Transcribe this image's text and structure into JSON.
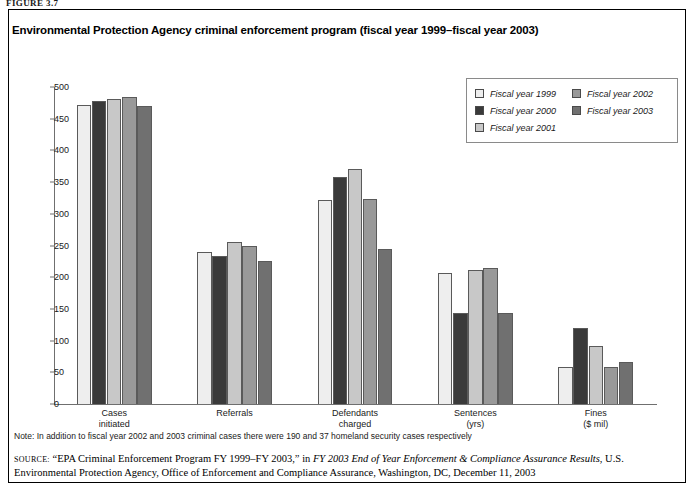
{
  "figure_label": "FIGURE 3.7",
  "chart_title": "Environmental Protection Agency criminal enforcement program (fiscal year 1999–fiscal year 2003)",
  "note": "Note: In addition to fiscal year 2002 and 2003 criminal cases there were 190 and 37 homeland security cases respectively",
  "source": {
    "label": "SOURCE:",
    "part1": " “EPA Criminal Enforcement Program FY 1999–FY 2003,” in ",
    "italic": "FY 2003 End of Year Enforcement & Compliance Assurance Results",
    "part2": ", U.S. Environmental Protection Agency, Office of Enforcement and Compliance Assurance, Washington, DC, December 11, 2003"
  },
  "legend": {
    "col1": [
      {
        "label": "Fiscal year 1999",
        "color": "#eeeeee"
      },
      {
        "label": "Fiscal year  2000",
        "color": "#3a3a3a"
      },
      {
        "label": "Fiscal year 2001",
        "color": "#c8c8c8"
      }
    ],
    "col2": [
      {
        "label": "Fiscal year 2002",
        "color": "#999999"
      },
      {
        "label": "Fiscal year 2003",
        "color": "#707070"
      }
    ]
  },
  "chart_data": {
    "type": "bar",
    "title": "Environmental Protection Agency criminal enforcement program (fiscal year 1999–fiscal year 2003)",
    "xlabel": "",
    "ylabel": "",
    "ylim": [
      0,
      500
    ],
    "yticks": [
      0,
      50,
      100,
      150,
      200,
      250,
      300,
      350,
      400,
      450,
      500
    ],
    "grid": false,
    "legend_position": "top-right",
    "categories": [
      "Cases\ninitiated",
      "Referrals",
      "Defendants\ncharged",
      "Sentences\n(yrs)",
      "Fines\n($ mil)"
    ],
    "category_lines": [
      [
        "Cases",
        "initiated"
      ],
      [
        "Referrals",
        ""
      ],
      [
        "Defendants",
        "charged"
      ],
      [
        "Sentences",
        "(yrs)"
      ],
      [
        "Fines",
        "($ mil)"
      ]
    ],
    "series": [
      {
        "name": "Fiscal year 1999",
        "color": "#eeeeee",
        "values": [
          472,
          239,
          322,
          207,
          59
        ]
      },
      {
        "name": "Fiscal year 2000",
        "color": "#3a3a3a",
        "values": [
          478,
          234,
          358,
          144,
          120
        ]
      },
      {
        "name": "Fiscal year 2001",
        "color": "#c8c8c8",
        "values": [
          481,
          255,
          370,
          211,
          91
        ]
      },
      {
        "name": "Fiscal year 2002",
        "color": "#999999",
        "values": [
          484,
          249,
          323,
          215,
          58
        ]
      },
      {
        "name": "Fiscal year 2003",
        "color": "#707070",
        "values": [
          470,
          226,
          244,
          143,
          66
        ]
      }
    ]
  }
}
